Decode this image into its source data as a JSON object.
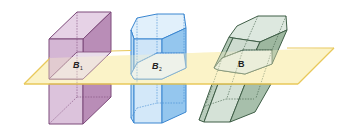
{
  "figure": {
    "colors": {
      "plane_fill": "#fbf3c8",
      "plane_stroke": "#e8c85a",
      "purple_fill": "#d9bfd9",
      "purple_dark": "#b488b2",
      "purple_stroke": "#7d4a7a",
      "blue_fill": "#cfe6f8",
      "blue_dark": "#8ec3ee",
      "blue_stroke": "#3a86d0",
      "green_fill": "#d8e4da",
      "green_dark": "#9fb9a4",
      "green_stroke": "#3f5e47"
    },
    "labels": {
      "purple_section": {
        "letter": "B",
        "sub": "1"
      },
      "blue_section": {
        "letter": "B",
        "sub": "2"
      },
      "green_section": {
        "letter": "B",
        "sub": ""
      }
    }
  }
}
